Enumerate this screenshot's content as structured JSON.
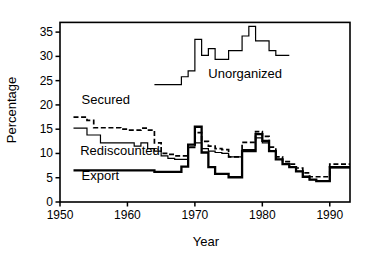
{
  "chart_data": {
    "type": "line",
    "title": "",
    "subtitle": "",
    "xlabel": "Year",
    "ylabel": "Percentage",
    "xlim": [
      1950,
      1993
    ],
    "ylim": [
      0,
      37
    ],
    "grid": false,
    "legend_position": "inline-annotations",
    "xticks": [
      1950,
      1960,
      1970,
      1980,
      1990
    ],
    "xtick_labels": [
      "1950",
      "1960",
      "1970",
      "1980",
      "1990"
    ],
    "yticks": [
      0,
      5,
      10,
      15,
      20,
      25,
      30,
      35
    ],
    "ytick_labels": [
      "0",
      "5",
      "10",
      "15",
      "20",
      "25",
      "30",
      "35"
    ],
    "annotations": [
      {
        "text": "Unorganized",
        "x": 1972.0,
        "y": 25.6
      },
      {
        "text": "Secured",
        "x": 1953.2,
        "y": 20.2
      },
      {
        "text": "Rediscounted",
        "x": 1953.0,
        "y": 9.6
      },
      {
        "text": "Export",
        "x": 1953.2,
        "y": 4.6
      }
    ],
    "series": [
      {
        "name": "Unorganized",
        "style": "step-solid-thin",
        "color": "#000000",
        "x": [
          1964,
          1965,
          1966,
          1967,
          1968,
          1969,
          1970,
          1971,
          1972,
          1973,
          1974,
          1975,
          1976,
          1977,
          1978,
          1979,
          1980,
          1981,
          1982,
          1983
        ],
        "values": [
          24.2,
          24.2,
          24.2,
          24.2,
          25.8,
          27.0,
          33.5,
          30.2,
          31.6,
          29.4,
          29.4,
          31.2,
          31.2,
          34.2,
          36.2,
          33.2,
          33.2,
          31.2,
          30.2,
          30.2
        ]
      },
      {
        "name": "Secured",
        "style": "step-dashed",
        "color": "#000000",
        "x": [
          1952,
          1953,
          1954,
          1955,
          1956,
          1957,
          1958,
          1959,
          1960,
          1961,
          1962,
          1963,
          1964,
          1965,
          1966,
          1967,
          1968,
          1969,
          1970,
          1971,
          1972,
          1973,
          1974,
          1975,
          1976,
          1977,
          1978,
          1979,
          1980,
          1981,
          1982,
          1983,
          1984,
          1985,
          1986,
          1987,
          1988,
          1989,
          1990,
          1991,
          1992,
          1993
        ],
        "values": [
          17.5,
          17.5,
          16.8,
          15.3,
          15.3,
          15.3,
          15.3,
          15.0,
          14.8,
          14.8,
          15.2,
          14.8,
          12.2,
          10.0,
          9.8,
          9.5,
          9.5,
          11.3,
          14.3,
          12.5,
          11.5,
          11.0,
          10.8,
          9.3,
          9.3,
          12.3,
          12.3,
          14.5,
          13.5,
          11.3,
          9.3,
          8.3,
          7.8,
          7.0,
          6.0,
          5.2,
          5.2,
          5.2,
          7.8,
          7.8,
          7.8,
          7.8
        ]
      },
      {
        "name": "Rediscounted",
        "style": "step-solid-thin",
        "color": "#000000",
        "x": [
          1952,
          1953,
          1954,
          1955,
          1956,
          1957,
          1958,
          1959,
          1960,
          1961,
          1962,
          1963,
          1964,
          1965,
          1966,
          1967,
          1968,
          1969,
          1970,
          1971,
          1972,
          1973,
          1974,
          1975,
          1976,
          1977,
          1978,
          1979,
          1980,
          1981,
          1982,
          1983,
          1984,
          1985,
          1986,
          1987,
          1988,
          1989,
          1990,
          1991,
          1992,
          1993
        ],
        "values": [
          15.2,
          15.2,
          13.8,
          13.8,
          12.2,
          12.2,
          12.2,
          12.2,
          12.2,
          11.5,
          12.2,
          11.0,
          10.5,
          9.5,
          9.0,
          8.8,
          8.8,
          11.2,
          12.2,
          11.0,
          10.5,
          10.2,
          10.0,
          9.3,
          9.3,
          10.8,
          10.8,
          13.2,
          12.2,
          10.5,
          8.8,
          7.8,
          7.2,
          6.3,
          5.2,
          4.6,
          4.4,
          4.4,
          7.0,
          7.0,
          7.0,
          7.0
        ]
      },
      {
        "name": "Export",
        "style": "step-solid-thick",
        "color": "#000000",
        "x": [
          1952,
          1953,
          1954,
          1955,
          1956,
          1957,
          1958,
          1959,
          1960,
          1961,
          1962,
          1963,
          1964,
          1965,
          1966,
          1967,
          1968,
          1969,
          1970,
          1971,
          1972,
          1973,
          1974,
          1975,
          1976,
          1977,
          1978,
          1979,
          1980,
          1981,
          1982,
          1983,
          1984,
          1985,
          1986,
          1987,
          1988,
          1989,
          1990,
          1991,
          1992,
          1993
        ],
        "values": [
          6.5,
          6.5,
          6.5,
          6.5,
          6.5,
          6.5,
          6.5,
          6.5,
          6.5,
          6.5,
          6.5,
          6.5,
          6.2,
          6.2,
          6.2,
          6.2,
          7.3,
          11.8,
          15.5,
          10.2,
          7.2,
          5.8,
          5.8,
          5.1,
          5.1,
          10.5,
          10.5,
          14.0,
          12.6,
          10.5,
          8.8,
          7.8,
          7.2,
          6.3,
          5.2,
          4.6,
          4.3,
          4.3,
          7.2,
          7.2,
          7.2,
          7.2
        ]
      }
    ]
  }
}
